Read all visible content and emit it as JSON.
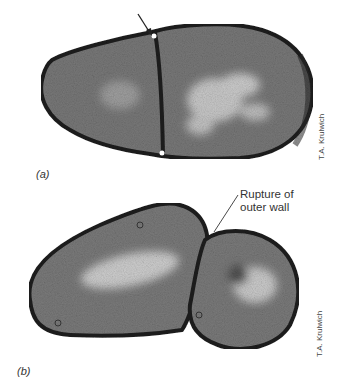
{
  "figure": {
    "panels": [
      {
        "label": "(a)",
        "credit": "T.A. Krulwich"
      },
      {
        "label": "(b)",
        "credit": "T.A. Krulwich"
      }
    ],
    "annotation": {
      "line1": "Rupture of",
      "line2": "outer wall"
    },
    "colors": {
      "cell_fill": "#7a7a7a",
      "cell_wall": "#1e1e1e",
      "light_region": "#d8d8d8",
      "background": "#ffffff"
    }
  }
}
